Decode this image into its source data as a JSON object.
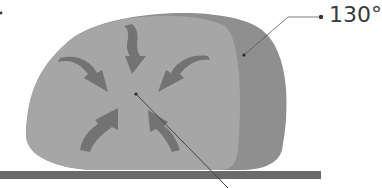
{
  "diagram": {
    "callout_label": "130°",
    "colors": {
      "outer_crust": "#8f8f8f",
      "inner_body": "#a6a6a6",
      "arrows": "#6e6e6e",
      "base_plate": "#6b6b6b",
      "leader_line": "#444444",
      "text": "#3a3a3a"
    },
    "arrows": [
      {
        "name": "top",
        "direction": "down"
      },
      {
        "name": "upper-left",
        "direction": "down-right"
      },
      {
        "name": "upper-right",
        "direction": "down-left"
      },
      {
        "name": "lower-left",
        "direction": "up-right"
      },
      {
        "name": "lower-right",
        "direction": "up-left"
      }
    ]
  }
}
